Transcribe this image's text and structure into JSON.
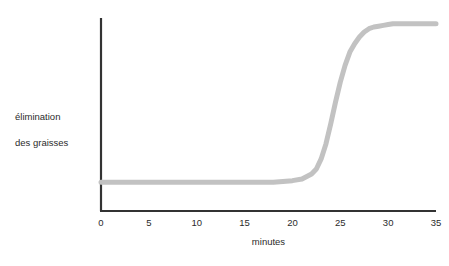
{
  "chart_data": {
    "type": "line",
    "title": "",
    "subtitle": "",
    "xlabel": "minutes",
    "ylabel": "élimination\ndes graisses",
    "ylabel_line1": "élimination",
    "ylabel_line2": "des graisses",
    "xlim": [
      0,
      35
    ],
    "ylim": [
      0,
      1
    ],
    "xticks": [
      0,
      5,
      10,
      15,
      20,
      25,
      30,
      35
    ],
    "xtick_labels": [
      "0",
      "5",
      "10",
      "15",
      "20",
      "25",
      "30",
      "35"
    ],
    "yticks": [],
    "ytick_labels": [],
    "grid": false,
    "legend": false,
    "legend_position": "none",
    "series": [
      {
        "name": "élimination des graisses",
        "color": "#c2c2c2",
        "line_width": 5,
        "x": [
          0,
          1,
          2,
          3,
          4,
          5,
          6,
          7,
          8,
          9,
          10,
          11,
          12,
          13,
          14,
          15,
          16,
          17,
          18,
          19,
          20,
          21,
          22,
          22.5,
          23,
          23.5,
          24,
          24.5,
          25,
          25.5,
          26,
          26.5,
          27,
          27.5,
          28,
          28.5,
          29,
          29.5,
          30,
          30.5,
          31,
          32,
          33,
          34,
          35
        ],
        "values": [
          0.04,
          0.04,
          0.04,
          0.04,
          0.04,
          0.04,
          0.04,
          0.04,
          0.04,
          0.04,
          0.04,
          0.04,
          0.04,
          0.04,
          0.04,
          0.04,
          0.04,
          0.04,
          0.04,
          0.045,
          0.05,
          0.06,
          0.09,
          0.12,
          0.18,
          0.27,
          0.39,
          0.52,
          0.64,
          0.74,
          0.82,
          0.87,
          0.91,
          0.94,
          0.96,
          0.97,
          0.975,
          0.98,
          0.985,
          0.99,
          0.99,
          0.99,
          0.99,
          0.99,
          0.99
        ]
      }
    ],
    "annotations": []
  },
  "axes": {
    "x_axis_name": "x-axis",
    "y_axis_name": "y-axis",
    "axis_color": "#333333"
  },
  "colors": {
    "background": "#ffffff",
    "curve": "#c2c2c2",
    "axis": "#333333",
    "text": "#2b2b2b"
  }
}
